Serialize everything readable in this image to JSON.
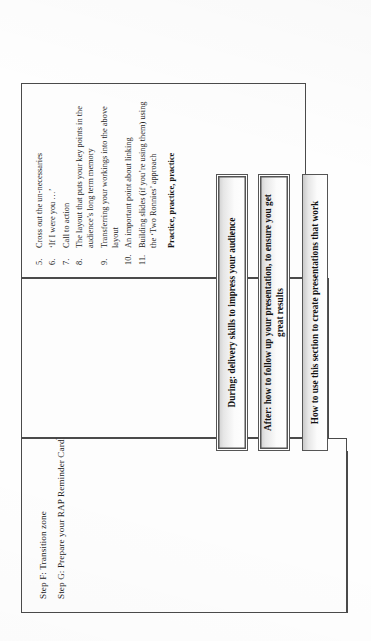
{
  "document": {
    "type": "flowchart-page",
    "orientation": "rotated-90-ccw"
  },
  "steps_box": {
    "lines": [
      "Step F: Transition zone",
      "Step G: Prepare your RAP Reminder Card"
    ],
    "trademark_symbol": "TM"
  },
  "list_box": {
    "items": [
      {
        "number": "5.",
        "text": "Cross out the un-necessaries"
      },
      {
        "number": "6.",
        "text": "‘If I were you …’"
      },
      {
        "number": "7.",
        "text": "Call to action"
      },
      {
        "number": "8.",
        "text": "The layout that puts your key points in the audience’s long term memory"
      },
      {
        "number": "9.",
        "text": "Transferring your workings into the above layout"
      },
      {
        "number": "10.",
        "text": "An important point about linking"
      },
      {
        "number": "11.",
        "text": "Building slides (if you’re using them) using the ‘Two Ronnies’ approach"
      }
    ],
    "footer": "Practice, practice, practice"
  },
  "banners": [
    {
      "id": "during",
      "label": "During: delivery skills to impress your audience"
    },
    {
      "id": "after",
      "label": "After: how to follow up your presentation, to ensure you get great results"
    },
    {
      "id": "howto",
      "label": "How to use this section to create presentations that work"
    }
  ],
  "colors": {
    "line": "#4a4a4a",
    "banner_top": "#c9c9c9",
    "banner_bottom": "#ffffff",
    "text": "#1a1a1a",
    "page": "#fefefe"
  }
}
